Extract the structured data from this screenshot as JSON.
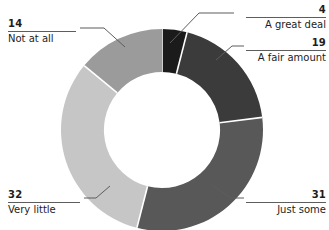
{
  "chart_data": {
    "type": "pie",
    "variant": "donut",
    "title": "",
    "subtitle": "",
    "xlabel": "",
    "ylabel": "",
    "units": "percent",
    "total": 100,
    "legend_position": "callout-labels",
    "grid": false,
    "start_angle_deg": 0,
    "direction": "clockwise",
    "inner_radius_ratio": 0.575,
    "categories": [
      "A great deal",
      "A fair amount",
      "Just some",
      "Very little",
      "Not at all"
    ],
    "values": [
      4,
      19,
      31,
      32,
      14
    ],
    "colors": [
      "#1b1b1b",
      "#3b3b3b",
      "#585858",
      "#c6c6c6",
      "#9b9b9b"
    ],
    "slices": [
      {
        "label": "A great deal",
        "value": 4,
        "color": "#1b1b1b"
      },
      {
        "label": "A fair amount",
        "value": 19,
        "color": "#3b3b3b"
      },
      {
        "label": "Just some",
        "value": 31,
        "color": "#585858"
      },
      {
        "label": "Very little",
        "value": 32,
        "color": "#c6c6c6"
      },
      {
        "label": "Not at all",
        "value": 14,
        "color": "#9b9b9b"
      }
    ]
  },
  "labels": {
    "great_deal": {
      "value": "4",
      "name": "A great deal"
    },
    "fair_amount": {
      "value": "19",
      "name": "A fair amount"
    },
    "just_some": {
      "value": "31",
      "name": "Just some"
    },
    "very_little": {
      "value": "32",
      "name": "Very little"
    },
    "not_at_all": {
      "value": "14",
      "name": "Not at all"
    }
  },
  "style": {
    "background": "#ffffff",
    "text_color": "#1d1d1d",
    "rule_color": "#5d5d5d",
    "separator_color": "#ffffff"
  }
}
